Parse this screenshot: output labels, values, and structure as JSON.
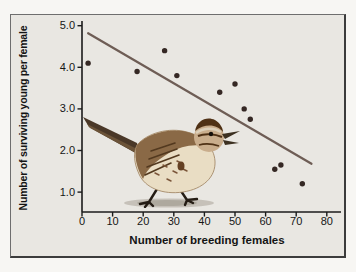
{
  "figure": {
    "panel_background": "#e9e7e2",
    "page_background": "#f7f6f3",
    "border_color": "#3c3c3c",
    "illustration": "song sparrow walking"
  },
  "chart_data": {
    "type": "scatter",
    "title": "",
    "xlabel": "Number of breeding females",
    "ylabel": "Number of surviving young per female",
    "xlim": [
      0,
      85
    ],
    "ylim": [
      0.5,
      5.1
    ],
    "x_ticks": [
      0,
      10,
      20,
      30,
      40,
      50,
      60,
      70,
      80
    ],
    "y_ticks": [
      1.0,
      2.0,
      3.0,
      4.0,
      5.0
    ],
    "y_tick_labels": [
      "1.0",
      "2.0",
      "3.0",
      "4.0",
      "5.0"
    ],
    "grid": false,
    "legend": null,
    "points": [
      [
        2,
        4.1
      ],
      [
        18,
        3.9
      ],
      [
        27,
        4.4
      ],
      [
        31,
        3.8
      ],
      [
        45,
        3.4
      ],
      [
        50,
        3.6
      ],
      [
        53,
        3.0
      ],
      [
        55,
        2.75
      ],
      [
        63,
        1.55
      ],
      [
        65,
        1.65
      ],
      [
        72,
        1.2
      ]
    ],
    "trend_line": {
      "x1": 2,
      "y1": 4.82,
      "x2": 75,
      "y2": 1.68
    },
    "point_color": "#352824",
    "trend_line_color": "#6e5d55",
    "axis_color": "#1b1b1b",
    "tick_label_color": "#161616"
  }
}
